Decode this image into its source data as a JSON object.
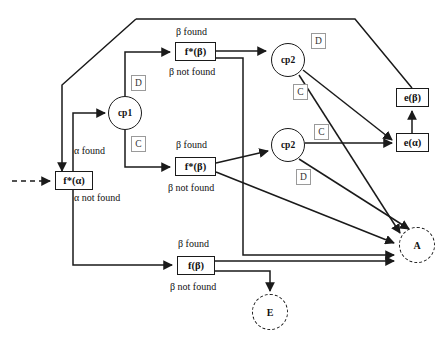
{
  "diagram": {
    "stroke_color": "#1a1a1a",
    "tag_color": "#9a9a9a",
    "background": "#ffffff"
  },
  "nodes": [
    {
      "id": "f_alpha",
      "label": "f*(α)",
      "type": "process-box",
      "x": 55,
      "y": 171,
      "w": 38,
      "h": 19
    },
    {
      "id": "cp1",
      "label": "cp1",
      "type": "decision-circle",
      "cx": 125,
      "cy": 113,
      "r": 17
    },
    {
      "id": "f_beta_top",
      "label": "f*(β)",
      "type": "process-box",
      "x": 175,
      "y": 42,
      "w": 41,
      "h": 19
    },
    {
      "id": "f_beta_mid",
      "label": "f*(β)",
      "type": "process-box",
      "x": 175,
      "y": 157,
      "w": 41,
      "h": 19
    },
    {
      "id": "f_beta_bot",
      "label": "f(β)",
      "type": "process-box",
      "x": 177,
      "y": 256,
      "w": 38,
      "h": 19
    },
    {
      "id": "cp2_top",
      "label": "cp2",
      "type": "decision-circle",
      "cx": 288,
      "cy": 60,
      "r": 17
    },
    {
      "id": "cp2_bot",
      "label": "cp2",
      "type": "decision-circle",
      "cx": 288,
      "cy": 145,
      "r": 17
    },
    {
      "id": "e_beta",
      "label": "e(β)",
      "type": "process-box",
      "x": 396,
      "y": 88,
      "w": 33,
      "h": 19
    },
    {
      "id": "e_alpha",
      "label": "e(α)",
      "type": "process-box",
      "x": 396,
      "y": 133,
      "w": 33,
      "h": 19
    },
    {
      "id": "node_a",
      "label": "A",
      "type": "dashed-circle",
      "cx": 417,
      "cy": 245,
      "r": 18
    },
    {
      "id": "node_e",
      "label": "E",
      "type": "dashed-circle",
      "cx": 270,
      "cy": 312,
      "r": 18
    }
  ],
  "branch_tags": [
    {
      "id": "cp1-d",
      "label": "D",
      "x": 131,
      "y": 75
    },
    {
      "id": "cp1-c",
      "label": "C",
      "x": 131,
      "y": 136
    },
    {
      "id": "cp2top-d",
      "label": "D",
      "x": 311,
      "y": 33
    },
    {
      "id": "cp2top-c",
      "label": "C",
      "x": 293,
      "y": 84
    },
    {
      "id": "cp2bot-c",
      "label": "C",
      "x": 314,
      "y": 124
    },
    {
      "id": "cp2bot-d",
      "label": "D",
      "x": 296,
      "y": 169
    }
  ],
  "edge_labels": [
    {
      "id": "alpha-found",
      "text": "α found",
      "x": 74,
      "y": 145
    },
    {
      "id": "alpha-not-found",
      "text": "α not found",
      "x": 74,
      "y": 192
    },
    {
      "id": "beta-found-top",
      "text": "β found",
      "x": 176,
      "y": 26
    },
    {
      "id": "beta-not-found-top",
      "text": "β not found",
      "x": 169,
      "y": 66
    },
    {
      "id": "beta-found-mid",
      "text": "β found",
      "x": 176,
      "y": 139
    },
    {
      "id": "beta-not-found-mid",
      "text": "β not found",
      "x": 168,
      "y": 182
    },
    {
      "id": "beta-found-bot",
      "text": "β found",
      "x": 178,
      "y": 238
    },
    {
      "id": "beta-not-found-bot",
      "text": "β not found",
      "x": 170,
      "y": 281
    }
  ],
  "edges": [
    {
      "from": "external",
      "to": "f_alpha",
      "style": "dashed"
    },
    {
      "from": "f_alpha",
      "to": "cp1",
      "label": "α found"
    },
    {
      "from": "f_alpha",
      "to": "f_beta_bot",
      "label": "α not found"
    },
    {
      "from": "cp1",
      "to": "f_beta_top",
      "tag": "D"
    },
    {
      "from": "cp1",
      "to": "f_beta_mid",
      "tag": "C"
    },
    {
      "from": "f_beta_top",
      "to": "cp2_top",
      "label": "β found"
    },
    {
      "from": "f_beta_top",
      "to": "node_a",
      "label": "β not found"
    },
    {
      "from": "f_beta_mid",
      "to": "cp2_bot",
      "label": "β found"
    },
    {
      "from": "f_beta_mid",
      "to": "node_a",
      "label": "β not found"
    },
    {
      "from": "f_beta_bot",
      "to": "node_a",
      "label": "β found"
    },
    {
      "from": "f_beta_bot",
      "to": "node_e",
      "label": "β not found"
    },
    {
      "from": "cp2_top",
      "to": "e_alpha",
      "tag": "D"
    },
    {
      "from": "cp2_top",
      "to": "node_a",
      "tag": "C"
    },
    {
      "from": "cp2_bot",
      "to": "e_alpha",
      "tag": "C"
    },
    {
      "from": "cp2_bot",
      "to": "node_a",
      "tag": "D"
    },
    {
      "from": "e_alpha",
      "to": "e_beta"
    },
    {
      "from": "e_beta",
      "to": "f_alpha",
      "style": "feedback-loop"
    }
  ]
}
